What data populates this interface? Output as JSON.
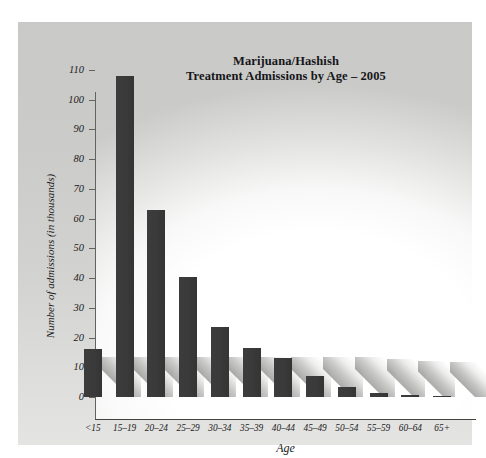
{
  "chart_data": {
    "type": "bar",
    "title": "Marijuana/Hashish\nTreatment Admissions by Age – 2005",
    "title_line1": "Marijuana/Hashish",
    "title_line2": "Treatment Admissions by Age – 2005",
    "xlabel": "Age",
    "ylabel": "Number of admissions (in thousands)",
    "categories": [
      "<15",
      "15–19",
      "20–24",
      "25–29",
      "30–34",
      "35–39",
      "40–44",
      "45–49",
      "50–54",
      "55–59",
      "60–64",
      "65+"
    ],
    "values": [
      16,
      108,
      63,
      40.5,
      23.5,
      16.5,
      13,
      7,
      3.5,
      1.5,
      0.8,
      0.5
    ],
    "ylim": [
      0,
      110
    ],
    "yticks": [
      0,
      10,
      20,
      30,
      40,
      50,
      60,
      70,
      80,
      90,
      100,
      110
    ],
    "ytick_labels": [
      "0",
      "10",
      "20",
      "30",
      "40",
      "50",
      "60",
      "70",
      "80",
      "90",
      "100",
      "110"
    ],
    "grid": false,
    "legend": null,
    "bar_color": "#3a3a3a",
    "panel_color": "#cdcdcb",
    "axis_color": "#44443f",
    "text_color": "#1b1b1d"
  }
}
